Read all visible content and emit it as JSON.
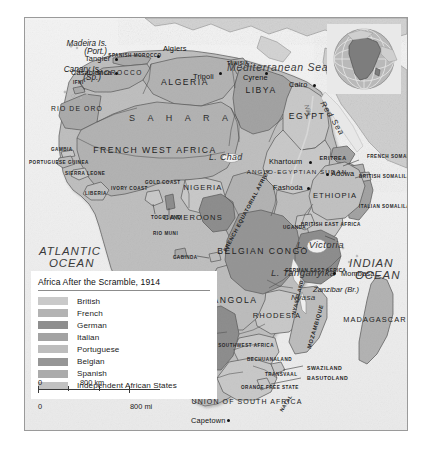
{
  "map": {
    "title": "Africa After the Scramble, 1914",
    "oceans": [
      {
        "name": "ATLANTIC OCEAN",
        "line1": "ATLANTIC",
        "line2": "OCEAN"
      },
      {
        "name": "INDIAN OCEAN",
        "line1": "INDIAN",
        "line2": "OCEAN"
      }
    ],
    "seas": [
      "Mediterranean Sea",
      "Red Sea"
    ],
    "lakes": [
      "L. Chad",
      "L. Victoria",
      "L. Tanganyika",
      "Nyasa"
    ],
    "sahara_label": "S A H A R A",
    "islands": [
      {
        "line1": "Madeira Is.",
        "line2": "(Port.)"
      },
      {
        "line1": "Canary Is.",
        "line2": "(Sp.)"
      },
      {
        "line1": "Zanzibar (Br.)",
        "line2": ""
      }
    ],
    "cities": [
      "Tangier",
      "Casablanca",
      "Algiers",
      "Tripoli",
      "Cyrene",
      "Cairo",
      "Khartoum",
      "Fashoda",
      "Adowa",
      "Mombasa",
      "Capetown"
    ],
    "territories": [
      "MOROCCO",
      "SPANISH MOROCCO",
      "IFNI",
      "RIO DE ORO",
      "ALGERIA",
      "TUNISIA",
      "LIBYA",
      "EGYPT",
      "FRENCH WEST AFRICA",
      "GAMBIA",
      "PORTUGUESE GUINEA",
      "SIERRA LEONE",
      "LIBERIA",
      "IVORY COAST",
      "GOLD COAST",
      "TOGOLAND",
      "NIGERIA",
      "CAMEROONS",
      "RIO MUNI",
      "FRENCH EQUATORIAL AFRICA",
      "ANGLO-EGYPTIAN SUDAN",
      "ERITREA",
      "FRENCH SOMALILAND",
      "BRITISH SOMALILAND",
      "ITALIAN SOMALILAND",
      "ETHIOPIA",
      "BRITISH EAST AFRICA",
      "UGANDA",
      "GERMAN EAST AFRICA",
      "BELGIAN CONGO",
      "CABINDA",
      "ANGOLA",
      "RHODESIA",
      "NYASALAND",
      "MOZAMBIQUE",
      "GERMAN SOUTHWEST AFRICA",
      "BECHUANALAND",
      "TRANSVAAL",
      "ORANGE FREE STATE",
      "SWAZILAND",
      "BASUTOLAND",
      "NATAL",
      "UNION OF SOUTH AFRICA",
      "MADAGASCAR"
    ]
  },
  "legend": {
    "title": "Africa After the Scramble, 1914",
    "items": [
      {
        "label": "British",
        "color": "#c9c9c9"
      },
      {
        "label": "French",
        "color": "#b3b3b3"
      },
      {
        "label": "German",
        "color": "#8e8e8e"
      },
      {
        "label": "Italian",
        "color": "#a3a3a3"
      },
      {
        "label": "Portuguese",
        "color": "#bdbdbd"
      },
      {
        "label": "Belgian",
        "color": "#969696"
      },
      {
        "label": "Spanish",
        "color": "#ababab"
      },
      {
        "label": "Independent African States",
        "color": "#c2c2c2"
      }
    ]
  },
  "scale": {
    "km": {
      "zero": "0",
      "max": "800 km"
    },
    "mi": {
      "zero": "0",
      "max": "800 mi"
    }
  },
  "inset": {
    "name": "globe-inset",
    "highlight": "Africa"
  }
}
